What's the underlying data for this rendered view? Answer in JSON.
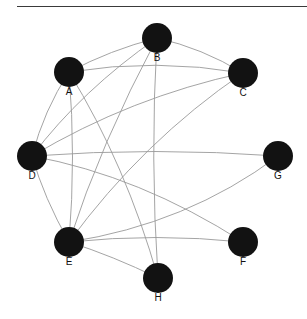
{
  "page": {
    "background_color": "#ffffff",
    "width": 307,
    "height": 319
  },
  "divider": {
    "name": "top-horizontal-rule",
    "color": "#3a3a3a",
    "x": 17,
    "y": 6,
    "width": 290,
    "height": 1
  },
  "chart_data": {
    "type": "diagram",
    "subtype": "node-link-graph",
    "title": "",
    "layout": "circular",
    "directed": false,
    "node_color": "#121212",
    "edge_color": "#9a9a9a",
    "label_color": "#111111",
    "node_radius": 15,
    "node_count": 8,
    "edge_count": 16,
    "nodes": [
      {
        "id": "A",
        "label": "A",
        "x": 69,
        "y": 72,
        "label_x": 69,
        "label_y": 92,
        "degree": 5
      },
      {
        "id": "B",
        "label": "B",
        "x": 157,
        "y": 38,
        "label_x": 157,
        "label_y": 58,
        "degree": 5
      },
      {
        "id": "C",
        "label": "C",
        "x": 243,
        "y": 73,
        "label_x": 243,
        "label_y": 93,
        "degree": 5
      },
      {
        "id": "D",
        "label": "D",
        "x": 32,
        "y": 156,
        "label_x": 32,
        "label_y": 176,
        "degree": 7
      },
      {
        "id": "E",
        "label": "E",
        "x": 69,
        "y": 242,
        "label_x": 69,
        "label_y": 262,
        "degree": 7
      },
      {
        "id": "F",
        "label": "F",
        "x": 243,
        "y": 242,
        "label_x": 243,
        "label_y": 262,
        "degree": 2
      },
      {
        "id": "G",
        "label": "G",
        "x": 278,
        "y": 156,
        "label_x": 278,
        "label_y": 176,
        "degree": 3
      },
      {
        "id": "H",
        "label": "H",
        "x": 158,
        "y": 278,
        "label_x": 158,
        "label_y": 298,
        "degree": 3
      }
    ],
    "edges": [
      {
        "id": "e1",
        "source": "A",
        "target": "B",
        "path": "M 69 72 Q 110 50 157 38"
      },
      {
        "id": "e2",
        "source": "A",
        "target": "C",
        "path": "M 69 72 Q 156 58 243 73"
      },
      {
        "id": "e3",
        "source": "A",
        "target": "D",
        "path": "M 69 72 Q 44 110 32 156"
      },
      {
        "id": "e4",
        "source": "A",
        "target": "E",
        "path": "M 69 72 Q 76 157 69 242"
      },
      {
        "id": "e5",
        "source": "A",
        "target": "H",
        "path": "M 69 72 Q 126 165 158 278"
      },
      {
        "id": "e6",
        "source": "B",
        "target": "C",
        "path": "M 157 38 Q 202 48 243 73"
      },
      {
        "id": "e7",
        "source": "B",
        "target": "D",
        "path": "M 157 38 Q 82 90 32 156"
      },
      {
        "id": "e8",
        "source": "B",
        "target": "E",
        "path": "M 157 38 Q 101 143 69 242"
      },
      {
        "id": "e9",
        "source": "B",
        "target": "H",
        "path": "M 157 38 Q 150 158 158 278"
      },
      {
        "id": "e10",
        "source": "C",
        "target": "D",
        "path": "M 243 73 Q 131 97 32 156"
      },
      {
        "id": "e11",
        "source": "C",
        "target": "E",
        "path": "M 243 73 Q 143 141 69 242"
      },
      {
        "id": "e12",
        "source": "D",
        "target": "E",
        "path": "M 32 156 Q 44 198 69 242"
      },
      {
        "id": "e13",
        "source": "D",
        "target": "F",
        "path": "M 32 156 Q 140 176 243 242"
      },
      {
        "id": "e14",
        "source": "D",
        "target": "G",
        "path": "M 32 156 Q 155 147 278 156"
      },
      {
        "id": "e15",
        "source": "E",
        "target": "F",
        "path": "M 69 242 Q 156 233 243 242"
      },
      {
        "id": "e16",
        "source": "E",
        "target": "G",
        "path": "M 69 242 Q 187 224 278 156"
      },
      {
        "id": "e17",
        "source": "E",
        "target": "H",
        "path": "M 69 242 Q 113 256 158 278"
      }
    ],
    "xlabel": "",
    "ylabel": "",
    "legend": [],
    "annotations": []
  }
}
